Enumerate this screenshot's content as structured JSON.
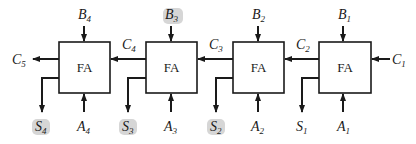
{
  "diagram": {
    "block_label": "FA",
    "blocks": [
      {
        "id": "fa4",
        "label": "FA",
        "x": 59,
        "b": "B",
        "b_sub": "4",
        "a": "A",
        "a_sub": "4",
        "s": "S",
        "s_sub": "4",
        "cout": "C",
        "cout_sub": "5"
      },
      {
        "id": "fa3",
        "label": "FA",
        "x": 146,
        "b": "B",
        "b_sub": "3",
        "a": "A",
        "a_sub": "3",
        "s": "S",
        "s_sub": "3",
        "cout": "C",
        "cout_sub": "4"
      },
      {
        "id": "fa2",
        "label": "FA",
        "x": 233,
        "b": "B",
        "b_sub": "2",
        "a": "A",
        "a_sub": "2",
        "s": "S",
        "s_sub": "2",
        "cout": "C",
        "cout_sub": "3"
      },
      {
        "id": "fa1",
        "label": "FA",
        "x": 319,
        "b": "B",
        "b_sub": "1",
        "a": "A",
        "a_sub": "1",
        "s": "S",
        "s_sub": "1",
        "cout": "C",
        "cout_sub": "2",
        "cin": "C",
        "cin_sub": "1"
      }
    ],
    "colors": {
      "line": "#1a1a1a",
      "background": "#ffffff",
      "highlight": "#d6d6d6"
    }
  }
}
